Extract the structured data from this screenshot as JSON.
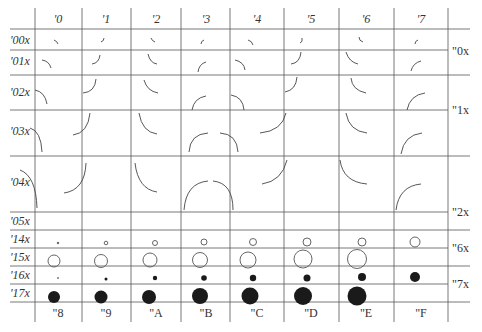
{
  "font_chart": {
    "column_headers": [
      "'0",
      "'1",
      "'2",
      "'3",
      "'4",
      "'5",
      "'6",
      "'7"
    ],
    "bottom_headers": [
      "\"8",
      "\"9",
      "\"A",
      "\"B",
      "\"C",
      "\"D",
      "\"E",
      "\"F"
    ],
    "row_headers": [
      "'00x",
      "'01x",
      "'02x",
      "'03x",
      "'04x",
      "'05x",
      "'14x",
      "'15x",
      "'16x",
      "'17x"
    ],
    "right_headers": [
      "\"0x",
      "\"1x",
      "\"2x",
      "\"6x",
      "\"7x"
    ],
    "glyph_rows": [
      {
        "row": "'00x",
        "glyphs": "quarter-circle arcs, smallest size, 8 orientations"
      },
      {
        "row": "'01x",
        "glyphs": "quarter-circle arcs, size 2, 8 orientations"
      },
      {
        "row": "'02x",
        "glyphs": "quarter-circle arcs, size 3, 8 orientations"
      },
      {
        "row": "'03x",
        "glyphs": "quarter-circle arcs, size 4, 8 orientations"
      },
      {
        "row": "'04x",
        "glyphs": "quarter-circle arcs, largest size, 8 orientations"
      },
      {
        "row": "'05x",
        "glyphs": "empty"
      },
      {
        "row": "'14x",
        "glyphs": "open circles, small, increasing size"
      },
      {
        "row": "'15x",
        "glyphs": "open circles, large, increasing size"
      },
      {
        "row": "'16x",
        "glyphs": "filled dots, small, increasing size"
      },
      {
        "row": "'17x",
        "glyphs": "filled dots, large, increasing size"
      }
    ]
  }
}
